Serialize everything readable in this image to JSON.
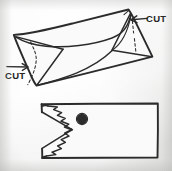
{
  "figure": {
    "medium": "hand-drawn pencil sketch on gray paper",
    "background_color": "#ececeb",
    "ink_color": "#2b2b2b"
  },
  "annotations": {
    "cut_left": {
      "label": "CUT",
      "icon": "arrow-right-icon",
      "arrow_direction": "right",
      "x": 22,
      "y": 74
    },
    "cut_right": {
      "label": "CUT",
      "icon": "arrow-left-icon",
      "arrow_direction": "left",
      "x": 140,
      "y": 19
    }
  },
  "top_figure": {
    "name": "envelope",
    "description": "tilted envelope with open triangular flaps and curved flap edge",
    "outline": "128,10 152,57 37,85 14,35",
    "cut_marks": 2
  },
  "bottom_figure": {
    "name": "cut-envelope-mouth",
    "description": "rectangle with zigzag toothed mouth opening on the left and a dark eye dot",
    "outline_box": {
      "x": 41,
      "y": 103,
      "width": 117,
      "height": 55
    },
    "eye": {
      "cx": 82,
      "cy": 119,
      "r": 5.2,
      "color": "#2b2b2b"
    },
    "teeth_count": 6
  }
}
